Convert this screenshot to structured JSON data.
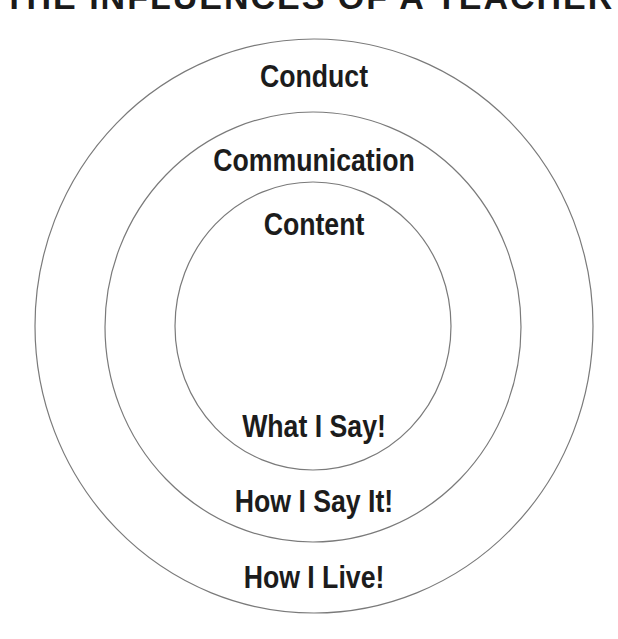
{
  "title": "THE INFLUENCES OF A TEACHER",
  "rings": [
    {
      "name": "outer",
      "top_label": "Conduct",
      "bottom_label": "How I Live!"
    },
    {
      "name": "middle",
      "top_label": "Communication",
      "bottom_label": "How I Say It!"
    },
    {
      "name": "inner",
      "top_label": "Content",
      "bottom_label": "What I Say!"
    }
  ],
  "colors": {
    "stroke": "#7a7a7a",
    "text": "#1c1c1c",
    "background": "#ffffff"
  }
}
